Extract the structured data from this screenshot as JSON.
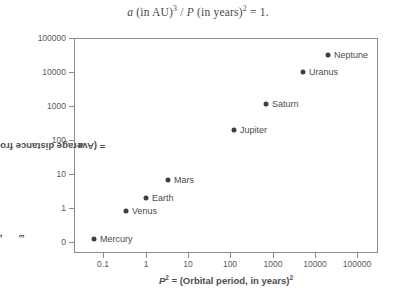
{
  "chart_data": {
    "type": "scatter",
    "title_parts": {
      "a_sym": "a",
      "a_rest": " (in AU)",
      "a_exp": "3",
      "slash": " / ",
      "p_sym": "P",
      "p_rest": " (in years)",
      "p_exp": "2",
      "equals": " = 1."
    },
    "xlabel": "P² = (Orbital period, in years)²",
    "xlabel_parts": {
      "sym": "P",
      "sym_exp": "2",
      "rest": " = (Orbital period, in years)",
      "rest_exp": "2"
    },
    "ylabel": "a³ = (Average distance from the Sun, in AU)³",
    "ylabel_parts": {
      "sym": "a",
      "sym_exp": "3",
      "rest": " = (Average distance from the Sun, in AU)",
      "rest_exp": "3"
    },
    "xticks": [
      "0.1",
      "1",
      "10",
      "100",
      "1000",
      "10000",
      "100000"
    ],
    "yticks": [
      "100000",
      "10000",
      "1000",
      "100",
      "10",
      "1",
      "0"
    ],
    "xscale": "log",
    "yscale": "log",
    "xlim": [
      0.0316,
      316228
    ],
    "ylim": [
      0.0316,
      316228
    ],
    "grid": false,
    "legend": null,
    "marker_color": "#3f3f3f",
    "frame_color": "#8c8c8c",
    "points": [
      {
        "label": "Mercury",
        "x": 0.058,
        "y": 0.058,
        "px": 94,
        "py": 239,
        "lx": 100,
        "ly": 239
      },
      {
        "label": "Venus",
        "x": 0.378,
        "y": 0.378,
        "px": 126,
        "py": 211,
        "lx": 132,
        "ly": 211
      },
      {
        "label": "Earth",
        "x": 1.0,
        "y": 1.0,
        "px": 146,
        "py": 198,
        "lx": 152,
        "ly": 198
      },
      {
        "label": "Mars",
        "x": 3.54,
        "y": 3.54,
        "px": 168,
        "py": 180,
        "lx": 174,
        "ly": 180
      },
      {
        "label": "Jupiter",
        "x": 140.7,
        "y": 140.7,
        "px": 234,
        "py": 130,
        "lx": 240,
        "ly": 130
      },
      {
        "label": "Saturn",
        "x": 867.7,
        "y": 867.7,
        "px": 266,
        "py": 104,
        "lx": 272,
        "ly": 104
      },
      {
        "label": "Uranus",
        "x": 7058.0,
        "y": 7058.0,
        "px": 303,
        "py": 72,
        "lx": 309,
        "ly": 72
      },
      {
        "label": "Neptune",
        "x": 27160.0,
        "y": 27160.0,
        "px": 328,
        "py": 55,
        "lx": 334,
        "ly": 55
      }
    ],
    "xtick_px": [
      103,
      146,
      188,
      230,
      273,
      315,
      357
    ],
    "ytick_py": [
      38,
      72,
      106,
      140,
      174,
      208,
      242
    ]
  }
}
